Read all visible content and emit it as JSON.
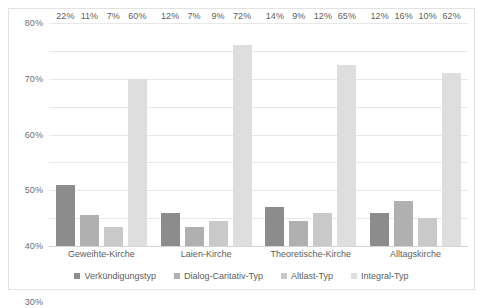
{
  "chart_data": {
    "type": "bar",
    "title": "",
    "subtitle": "",
    "xlabel": "",
    "ylabel": "",
    "ylim": [
      0,
      80
    ],
    "ytick_labels": [
      "0%",
      "10%",
      "20%",
      "30%",
      "40%",
      "50%",
      "60%",
      "70%",
      "80%"
    ],
    "ytick_values": [
      0,
      10,
      20,
      30,
      40,
      50,
      60,
      70,
      80
    ],
    "grid": true,
    "legend_position": "bottom",
    "value_suffix": "%",
    "categories": [
      "Geweihte-Kirche",
      "Laien-Kirche",
      "Theoretische-Kirche",
      "Alltagskirche"
    ],
    "series": [
      {
        "name": "Verkündigungstyp",
        "color": "#8c8c8c",
        "values": [
          22,
          12,
          14,
          12
        ],
        "labels": [
          "22%",
          "12%",
          "14%",
          "12%"
        ]
      },
      {
        "name": "Dialog-Caritativ-Typ",
        "color": "#b0b0b0",
        "values": [
          11,
          7,
          9,
          16
        ],
        "labels": [
          "11%",
          "7%",
          "9%",
          "16%"
        ]
      },
      {
        "name": "Altlast-Typ",
        "color": "#c9c9c9",
        "values": [
          7,
          9,
          12,
          10
        ],
        "labels": [
          "7%",
          "9%",
          "12%",
          "10%"
        ]
      },
      {
        "name": "Integral-Typ",
        "color": "#dedede",
        "values": [
          60,
          72,
          65,
          62
        ],
        "labels": [
          "60%",
          "72%",
          "65%",
          "62%"
        ]
      }
    ]
  },
  "colors": {
    "plot_border": "#e2e2e2",
    "gridline": "#e8e8e8",
    "axis_text": "#6f6f6f",
    "label_text": "#5e5e5e",
    "background": "#ffffff"
  }
}
